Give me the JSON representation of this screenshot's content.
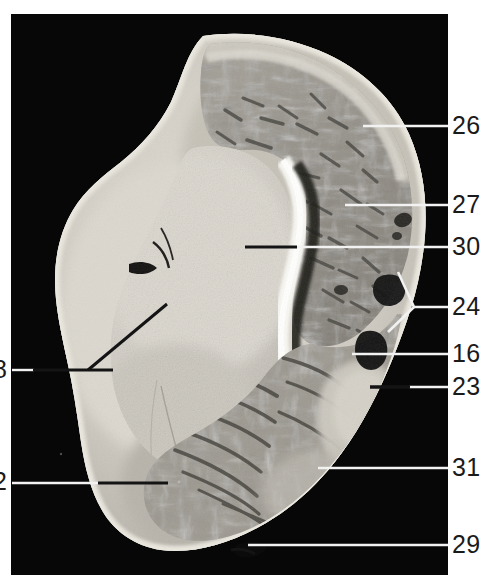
{
  "figure": {
    "kind": "anatomical-cross-section-photograph",
    "plate": {
      "background_color": "#070707",
      "x": 11,
      "y": 14,
      "width": 437,
      "height": 561
    },
    "page_background": "#ffffff"
  },
  "labels": {
    "right": [
      {
        "id": "label-26",
        "text": "26",
        "x": 452,
        "y": 113,
        "leader": {
          "style": "white",
          "from_x": 448,
          "from_y": 126,
          "to_x": 363,
          "to_y": 126
        }
      },
      {
        "id": "label-27",
        "text": "27",
        "x": 452,
        "y": 192,
        "leader": {
          "style": "white",
          "from_x": 448,
          "from_y": 205,
          "to_x": 345,
          "to_y": 205
        }
      },
      {
        "id": "label-30",
        "text": "30",
        "x": 452,
        "y": 234,
        "leader": {
          "style": "white",
          "from_x": 448,
          "from_y": 247,
          "to_x": 295,
          "to_y": 247
        },
        "leader2": {
          "style": "black",
          "from_x": 295,
          "from_y": 247,
          "to_x": 245,
          "to_y": 247
        }
      },
      {
        "id": "label-24",
        "text": "24",
        "x": 452,
        "y": 294,
        "leader": {
          "style": "white-fork",
          "hub_x": 448,
          "hub_y": 307,
          "branch_a_x": 398,
          "branch_a_y": 272,
          "branch_b_x": 388,
          "branch_b_y": 332
        }
      },
      {
        "id": "label-16",
        "text": "16",
        "x": 452,
        "y": 341,
        "leader": {
          "style": "white",
          "from_x": 448,
          "from_y": 354,
          "to_x": 352,
          "to_y": 354
        }
      },
      {
        "id": "label-23",
        "text": "23",
        "x": 452,
        "y": 374,
        "leader": {
          "style": "white",
          "from_x": 448,
          "from_y": 387,
          "to_x": 408,
          "to_y": 387
        },
        "leader2": {
          "style": "black",
          "from_x": 408,
          "from_y": 387,
          "to_x": 370,
          "to_y": 387
        }
      },
      {
        "id": "label-31",
        "text": "31",
        "x": 452,
        "y": 455,
        "leader": {
          "style": "white",
          "from_x": 448,
          "from_y": 468,
          "to_x": 318,
          "to_y": 468
        }
      },
      {
        "id": "label-29",
        "text": "29",
        "x": 452,
        "y": 532,
        "leader": {
          "style": "white",
          "from_x": 448,
          "from_y": 545,
          "to_x": 248,
          "to_y": 545
        }
      }
    ],
    "left": [
      {
        "id": "label-8",
        "text": "8",
        "x": -7,
        "y": 357,
        "cropped": true,
        "leader": {
          "style": "white",
          "from_x": 14,
          "from_y": 370,
          "to_x": 30,
          "to_y": 370
        },
        "leader2": {
          "style": "black",
          "from_x": 30,
          "from_y": 370,
          "to_x": 113,
          "to_y": 370
        },
        "leader3": {
          "style": "black-branch",
          "from_x": 88,
          "from_y": 370,
          "to_x": 167,
          "to_y": 304
        }
      },
      {
        "id": "label-2",
        "text": "2",
        "x": -7,
        "y": 469,
        "cropped": true,
        "leader": {
          "style": "white",
          "from_x": 12,
          "from_y": 483,
          "to_x": 98,
          "to_y": 483
        },
        "leader2": {
          "style": "black",
          "from_x": 98,
          "from_y": 483,
          "to_x": 168,
          "to_y": 483
        }
      }
    ]
  },
  "colors": {
    "plate_black": "#070707",
    "leader_white": "#f2f2f2",
    "leader_black": "#141414",
    "label_text": "#1a1a1a",
    "bone_light": "#d8d4cc",
    "cartilage_bright": "#f4f2ec",
    "trabecular_mid": "#9e9a92",
    "trabecular_dark": "#5d5a55",
    "marrow_dark": "#2a2824"
  }
}
